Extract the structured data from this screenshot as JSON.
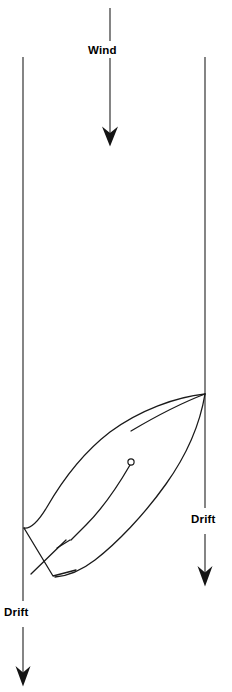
{
  "figure": {
    "background_color": "#ffffff",
    "line_color": "#1a1a1a",
    "width": 232,
    "height": 692
  },
  "labels": {
    "wind": "Wind",
    "drift_right": "Drift",
    "drift_left": "Drift"
  },
  "arrows": {
    "wind": {
      "name": "wind-arrow",
      "direction": "down",
      "x": 110,
      "y_start": 8,
      "y_end": 146,
      "label_y": 52
    },
    "drift_right": {
      "name": "drift-arrow-right",
      "direction": "down",
      "x": 205,
      "y_start": 57,
      "y_end": 586,
      "label_y": 521
    },
    "drift_left": {
      "name": "drift-arrow-left",
      "direction": "down",
      "x": 23,
      "y_start": 57,
      "y_end": 686,
      "label_y": 614
    }
  },
  "boat": {
    "name": "sailboat",
    "bow_point": [
      205,
      394
    ],
    "stern_point": [
      24,
      528
    ],
    "mast_position": [
      131,
      462
    ],
    "mast_ring_radius": 3.1,
    "heading": "bow up-right, stern down-left"
  }
}
